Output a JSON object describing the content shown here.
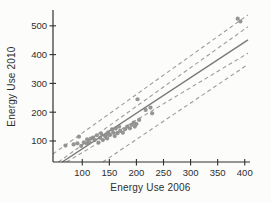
{
  "figure": {
    "background": "#fcfcfa"
  },
  "chart_data": {
    "type": "scatter",
    "title": "",
    "xlabel": "Energy Use 2006",
    "ylabel": "Energy Use 2010",
    "x_ticks": [
      100,
      150,
      200,
      250,
      300,
      350,
      400
    ],
    "y_ticks": [
      100,
      200,
      300,
      400,
      500
    ],
    "xlim": [
      46,
      406
    ],
    "ylim": [
      27,
      555
    ],
    "grid": false,
    "legend": "none",
    "points": [
      [
        69,
        84
      ],
      [
        84,
        88
      ],
      [
        91,
        92
      ],
      [
        94,
        115
      ],
      [
        98,
        83
      ],
      [
        103,
        95
      ],
      [
        108,
        92
      ],
      [
        109,
        106
      ],
      [
        113,
        95
      ],
      [
        116,
        108
      ],
      [
        120,
        112
      ],
      [
        123,
        103
      ],
      [
        127,
        120
      ],
      [
        130,
        94
      ],
      [
        133,
        111
      ],
      [
        135,
        125
      ],
      [
        138,
        103
      ],
      [
        142,
        117
      ],
      [
        144,
        122
      ],
      [
        146,
        109
      ],
      [
        148,
        130
      ],
      [
        151,
        121
      ],
      [
        155,
        140
      ],
      [
        157,
        129
      ],
      [
        160,
        117
      ],
      [
        162,
        143
      ],
      [
        165,
        127
      ],
      [
        168,
        150
      ],
      [
        170,
        135
      ],
      [
        175,
        129
      ],
      [
        179,
        141
      ],
      [
        183,
        150
      ],
      [
        188,
        144
      ],
      [
        191,
        156
      ],
      [
        195,
        164
      ],
      [
        197,
        150
      ],
      [
        200,
        159
      ],
      [
        202,
        245
      ],
      [
        205,
        173
      ],
      [
        217,
        208
      ],
      [
        226,
        216
      ],
      [
        229,
        196
      ],
      [
        387,
        525
      ],
      [
        392,
        515
      ]
    ],
    "regression_line": {
      "name": "fit-line",
      "style": "solid",
      "x1": 63,
      "y1": 27,
      "x2": 406,
      "y2": 451
    },
    "bands": [
      {
        "name": "confidence-upper",
        "style": "dashed",
        "x1": 56,
        "y1": 27,
        "x2": 406,
        "y2": 497
      },
      {
        "name": "confidence-lower",
        "style": "dashed",
        "x1": 71,
        "y1": 27,
        "x2": 406,
        "y2": 405
      },
      {
        "name": "prediction-upper",
        "style": "dashed",
        "x1": 46,
        "y1": 55,
        "x2": 406,
        "y2": 538
      },
      {
        "name": "prediction-lower",
        "style": "dashed",
        "x1": 138,
        "y1": 27,
        "x2": 406,
        "y2": 366
      }
    ],
    "colors": {
      "point": "#8c8c8c",
      "fit_line": "#7a7a7a",
      "band_line": "#9c9c9c",
      "axis": "#2f2f2f",
      "tick_text": "#2e2e2e"
    },
    "plot_area_px": {
      "left": 53,
      "right": 248,
      "top": 10,
      "bottom": 162
    },
    "point_radius_px": 2.1,
    "tick_font_px": 9.5
  }
}
